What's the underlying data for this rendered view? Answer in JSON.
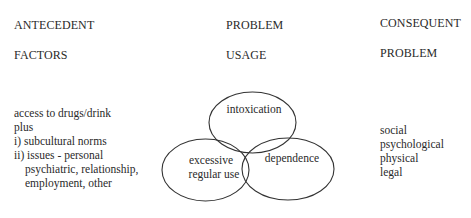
{
  "columns": {
    "antecedent": {
      "line1": "ANTECEDENT",
      "line2": "FACTORS",
      "items": [
        "access to drugs/drink",
        "plus",
        "i) subcultural norms",
        "ii) issues - personal",
        "psychiatric, relationship,",
        "employment, other"
      ]
    },
    "problem_usage": {
      "line1": "PROBLEM",
      "line2": "USAGE",
      "venn": [
        {
          "label_lines": [
            "intoxication"
          ]
        },
        {
          "label_lines": [
            "excessive",
            "regular use"
          ]
        },
        {
          "label_lines": [
            "dependence"
          ]
        }
      ]
    },
    "consequent": {
      "line1": "CONSEQUENT",
      "line2": "PROBLEM",
      "items": [
        "social",
        "psychological",
        "physical",
        "legal"
      ]
    }
  },
  "colors": {
    "text": "#2a2a2a",
    "stroke": "#333333",
    "background": "#ffffff"
  }
}
